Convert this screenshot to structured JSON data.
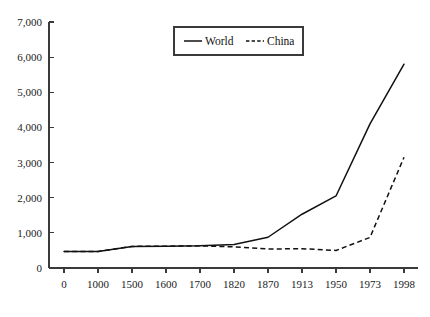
{
  "chart_data": {
    "type": "line",
    "title": "",
    "xlabel": "",
    "ylabel": "",
    "categories": [
      "0",
      "1000",
      "1500",
      "1600",
      "1700",
      "1820",
      "1870",
      "1913",
      "1950",
      "1973",
      "1998"
    ],
    "series": [
      {
        "name": "World",
        "style": "solid",
        "values": [
          470,
          470,
          615,
          620,
          630,
          670,
          875,
          1530,
          2050,
          4100,
          5800
        ]
      },
      {
        "name": "China",
        "style": "dashed",
        "values": [
          470,
          470,
          615,
          620,
          630,
          600,
          540,
          550,
          500,
          870,
          3150
        ]
      }
    ],
    "ylim": [
      0,
      7000
    ],
    "ytick_values": [
      0,
      1000,
      2000,
      3000,
      4000,
      5000,
      6000,
      7000
    ],
    "ytick_labels": [
      "0",
      "1,000",
      "2,000",
      "3,000",
      "4,000",
      "5,000",
      "6,000",
      "7,000"
    ],
    "grid": false,
    "legend_position": "top-center",
    "legend_entries": [
      {
        "label": "World",
        "style": "solid"
      },
      {
        "label": "China",
        "style": "dashed"
      }
    ],
    "colors": {
      "axis": "#3a3a3a",
      "world_line": "#111111",
      "china_line": "#111111",
      "background": "#ffffff"
    }
  }
}
